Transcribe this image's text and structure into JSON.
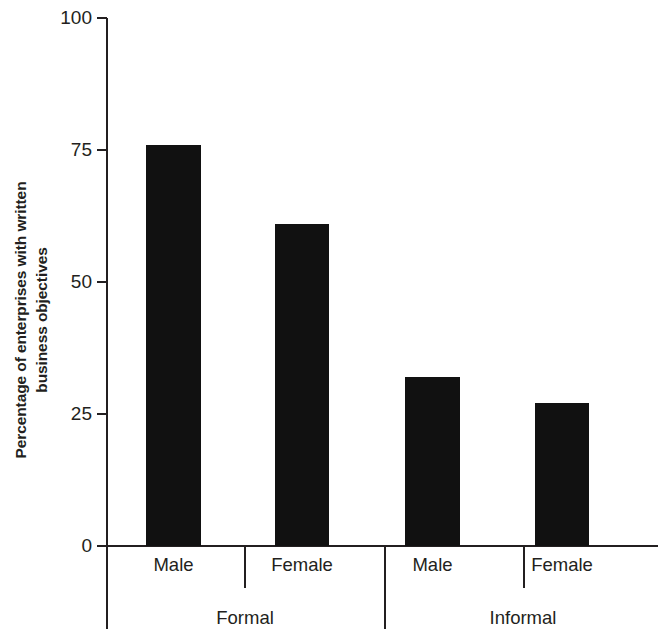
{
  "chart_data": {
    "type": "bar",
    "title": "",
    "subtitle": "",
    "xlabel": "",
    "ylabel": "Percentage of enterprises with written business objectives",
    "ylabel_lines": [
      "Percentage of enterprises with written",
      "business objectives"
    ],
    "ylim": [
      0,
      100
    ],
    "yticks": [
      0,
      25,
      50,
      75,
      100
    ],
    "ytick_labels": [
      "0",
      "25",
      "50",
      "75",
      "100"
    ],
    "grid": false,
    "legend": null,
    "categories": [
      "Male",
      "Female",
      "Male",
      "Female"
    ],
    "groups": [
      {
        "label": "Formal",
        "categories": [
          "Male",
          "Female"
        ],
        "values": [
          76,
          61
        ]
      },
      {
        "label": "Informal",
        "categories": [
          "Male",
          "Female"
        ],
        "values": [
          32,
          27
        ]
      }
    ],
    "values": [
      76,
      61,
      32,
      27
    ],
    "bar_color": "#111111",
    "axis_color": "#231f20",
    "background": "#ffffff"
  },
  "axis": {
    "y_tick_labels": [
      "100",
      "75",
      "50",
      "25",
      "0"
    ],
    "y_tick_values": [
      100,
      75,
      50,
      25,
      0
    ]
  },
  "bars": [
    {
      "label": "Male",
      "group": "Formal",
      "value": 76
    },
    {
      "label": "Female",
      "group": "Formal",
      "value": 61
    },
    {
      "label": "Male",
      "group": "Informal",
      "value": 32
    },
    {
      "label": "Female",
      "group": "Informal",
      "value": 27
    }
  ],
  "group_labels": [
    "Formal",
    "Informal"
  ]
}
